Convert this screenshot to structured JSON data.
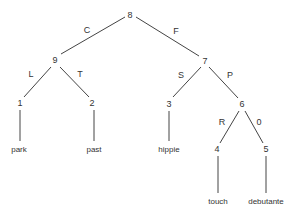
{
  "diagram": {
    "type": "tree",
    "nodes": [
      {
        "id": "8",
        "label": "8",
        "x": 130,
        "y": 15
      },
      {
        "id": "9",
        "label": "9",
        "x": 55,
        "y": 60
      },
      {
        "id": "7",
        "label": "7",
        "x": 205,
        "y": 61
      },
      {
        "id": "1",
        "label": "1",
        "x": 20,
        "y": 103
      },
      {
        "id": "2",
        "label": "2",
        "x": 92,
        "y": 103
      },
      {
        "id": "3",
        "label": "3",
        "x": 169,
        "y": 104
      },
      {
        "id": "6",
        "label": "6",
        "x": 242,
        "y": 104
      },
      {
        "id": "4",
        "label": "4",
        "x": 217,
        "y": 149
      },
      {
        "id": "5",
        "label": "5",
        "x": 266,
        "y": 149
      }
    ],
    "leaves": [
      {
        "parent": "1",
        "label": "park",
        "x": 19,
        "y": 150
      },
      {
        "parent": "2",
        "label": "past",
        "x": 94,
        "y": 150
      },
      {
        "parent": "3",
        "label": "hippie",
        "x": 169,
        "y": 150
      },
      {
        "parent": "4",
        "label": "touch",
        "x": 218,
        "y": 202
      },
      {
        "parent": "5",
        "label": "debutante",
        "x": 266,
        "y": 202
      }
    ],
    "edges": [
      {
        "from": "8",
        "to": "9",
        "label": "C",
        "lx": 87,
        "ly": 30
      },
      {
        "from": "8",
        "to": "7",
        "label": "F",
        "lx": 176,
        "ly": 31
      },
      {
        "from": "9",
        "to": "1",
        "label": "L",
        "lx": 31,
        "ly": 74
      },
      {
        "from": "9",
        "to": "2",
        "label": "T",
        "lx": 80,
        "ly": 74
      },
      {
        "from": "7",
        "to": "3",
        "label": "S",
        "lx": 181,
        "ly": 75
      },
      {
        "from": "7",
        "to": "6",
        "label": "P",
        "lx": 230,
        "ly": 75
      },
      {
        "from": "6",
        "to": "4",
        "label": "R",
        "lx": 222,
        "ly": 122
      },
      {
        "from": "6",
        "to": "5",
        "label": "0",
        "lx": 259,
        "ly": 122
      }
    ]
  }
}
